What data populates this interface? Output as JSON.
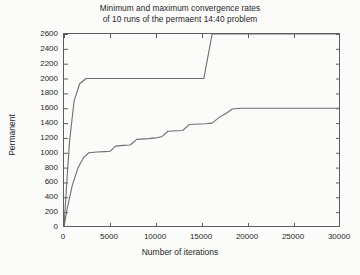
{
  "chart_data": {
    "type": "line",
    "title": "Minimum and maximum convergence rates of 10 runs of the permaent 14:40 problem",
    "title_lines": [
      "Minimum and maximum convergence rates",
      "of 10 runs of the permaent 14:40 problem"
    ],
    "xlabel": "Number of iterations",
    "ylabel": "Permanent",
    "xlim": [
      0,
      30000
    ],
    "ylim": [
      0,
      2600
    ],
    "xticks": [
      0,
      5000,
      10000,
      15000,
      20000,
      25000,
      30000
    ],
    "xtick_labels": [
      "0",
      "5000",
      "10000",
      "15000",
      "20000",
      "25000",
      "30000"
    ],
    "yticks": [
      0,
      200,
      400,
      600,
      800,
      1000,
      1200,
      1400,
      1600,
      1800,
      2000,
      2200,
      2400,
      2600
    ],
    "ytick_labels": [
      "0",
      "200",
      "400",
      "600",
      "800",
      "1000",
      "1200",
      "1400",
      "1600",
      "1800",
      "2000",
      "2200",
      "2400",
      "2600"
    ],
    "grid": false,
    "legend": "none",
    "line_color": "#6e6e6e",
    "axis_color": "#5c5c5c",
    "series": [
      {
        "name": "maximum",
        "points": [
          [
            0,
            0
          ],
          [
            250,
            500
          ],
          [
            600,
            1150
          ],
          [
            1100,
            1700
          ],
          [
            1700,
            1930
          ],
          [
            2400,
            2000
          ],
          [
            15200,
            2000
          ],
          [
            16100,
            2600
          ],
          [
            30000,
            2600
          ]
        ]
      },
      {
        "name": "minimum",
        "points": [
          [
            0,
            0
          ],
          [
            300,
            220
          ],
          [
            900,
            560
          ],
          [
            1500,
            790
          ],
          [
            2100,
            930
          ],
          [
            2700,
            1000
          ],
          [
            3600,
            1010
          ],
          [
            4400,
            1015
          ],
          [
            5000,
            1020
          ],
          [
            5600,
            1090
          ],
          [
            6400,
            1100
          ],
          [
            7200,
            1105
          ],
          [
            7900,
            1180
          ],
          [
            9200,
            1190
          ],
          [
            9900,
            1200
          ],
          [
            10600,
            1215
          ],
          [
            11300,
            1290
          ],
          [
            12900,
            1300
          ],
          [
            13600,
            1380
          ],
          [
            15400,
            1390
          ],
          [
            16100,
            1400
          ],
          [
            16900,
            1480
          ],
          [
            17600,
            1530
          ],
          [
            18300,
            1590
          ],
          [
            19100,
            1600
          ],
          [
            30000,
            1600
          ]
        ]
      }
    ]
  }
}
